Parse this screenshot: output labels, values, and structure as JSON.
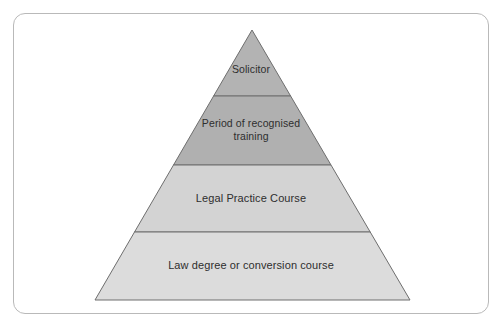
{
  "diagram": {
    "type": "pyramid",
    "orientation": "apex-top",
    "frame": {
      "shape": "rounded-rectangle",
      "border_color": "#b9b9b9",
      "background_color": "#ffffff"
    },
    "geometry": {
      "apex_x": 252,
      "apex_y": 30,
      "base_left_x": 95,
      "base_right_x": 410,
      "base_y": 300,
      "divider_y": [
        96,
        165,
        232
      ]
    },
    "outline_color": "#6e6e6e",
    "text_color": "#2e2e2e",
    "tiers": [
      {
        "index": 1,
        "position": "top",
        "label": "Solicitor",
        "fill_color": "#b3b3b3"
      },
      {
        "index": 2,
        "position": "upper-middle",
        "label": "Period of recognised\ntraining",
        "fill_color": "#b0b0b0"
      },
      {
        "index": 3,
        "position": "lower-middle",
        "label": "Legal Practice Course",
        "fill_color": "#d3d3d3"
      },
      {
        "index": 4,
        "position": "bottom",
        "label": "Law degree or conversion course",
        "fill_color": "#dcdcdc"
      }
    ]
  }
}
